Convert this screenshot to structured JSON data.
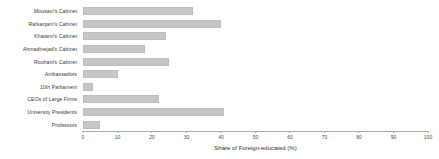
{
  "chart_data": {
    "type": "bar",
    "orientation": "horizontal",
    "title": "",
    "subtitle": "",
    "xlabel": "Share of Foreign-educated (%)",
    "ylabel": "",
    "xlim": [
      0,
      100
    ],
    "xticks": [
      0,
      10,
      20,
      30,
      40,
      50,
      60,
      70,
      80,
      90,
      100
    ],
    "xtick_labels": [
      "0",
      "10",
      "20",
      "30",
      "40",
      "50",
      "60",
      "70",
      "80",
      "90",
      "100"
    ],
    "grid": false,
    "legend": false,
    "legend_position": "none",
    "bar_color": "#c6c6c6",
    "categories": [
      "Mousavi's Cabinet",
      "Rafsanjani's Cabinet",
      "Khatami's Cabinet",
      "Ahmadinejad's Cabinet",
      "Rouhani's Cabinet",
      "Ambassadors",
      "10th Parliament",
      "CEOs of Large Firms",
      "University Presidents",
      "Professors"
    ],
    "values": [
      32,
      40,
      24,
      18,
      25,
      10,
      3,
      22,
      41,
      5
    ]
  }
}
